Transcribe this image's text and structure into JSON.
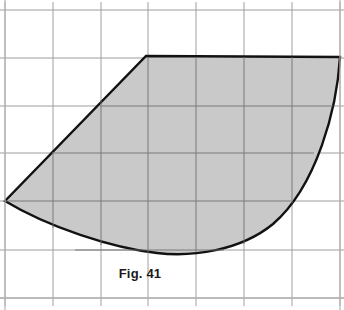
{
  "figure": {
    "caption": "Fig. 41",
    "page_background": "#ffffff",
    "frame": {
      "border_color": "#b4b4b4",
      "top_y": 10,
      "bottom_y": 298,
      "left_x": 5,
      "right_x": 340
    },
    "grid": {
      "line_color": "#9a9a9a",
      "line_width": 1,
      "spacing_px": 47.8,
      "x_positions": [
        5,
        53,
        101,
        148,
        196,
        244,
        292,
        340
      ],
      "y_positions": [
        10,
        58,
        106,
        153,
        201,
        250,
        298
      ],
      "columns": 7,
      "rows": 6
    },
    "shape": {
      "name": "shaded-lens-sector",
      "fill_color": "#c9c9c9",
      "stroke_color": "#121212",
      "stroke_width": 2.4,
      "vertices": {
        "top_left": [
          146,
          56
        ],
        "top_right": [
          340,
          57
        ],
        "left_point": [
          5,
          201
        ],
        "bottom_low_point": [
          157,
          253
        ]
      },
      "edges": [
        {
          "name": "top-straight-edge",
          "type": "line",
          "from": [
            146,
            56
          ],
          "to": [
            340,
            57
          ]
        },
        {
          "name": "right-convex-arc",
          "type": "curve",
          "from": [
            340,
            57
          ],
          "to": [
            157,
            253
          ],
          "control_points": [
            [
              333,
              150
            ],
            [
              262,
              232
            ]
          ]
        },
        {
          "name": "bottom-concave-arc",
          "type": "curve",
          "from": [
            157,
            253
          ],
          "to": [
            5,
            201
          ],
          "control_points": [
            [
              90,
              249
            ],
            [
              33,
              226
            ]
          ]
        },
        {
          "name": "upper-left-straight-edge",
          "type": "line",
          "from": [
            5,
            201
          ],
          "to": [
            146,
            56
          ]
        }
      ]
    }
  }
}
